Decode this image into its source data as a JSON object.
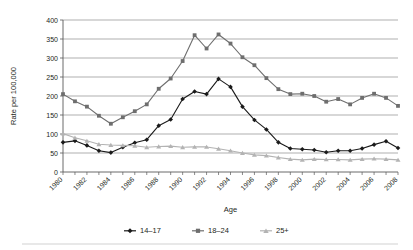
{
  "chart_data": {
    "type": "line",
    "title": "",
    "xlabel": "Age",
    "ylabel": "Rate per 100,000",
    "ylim": [
      0,
      400
    ],
    "ytick_step": 50,
    "yticks": [
      "0",
      "50",
      "100",
      "150",
      "200",
      "250",
      "300",
      "350",
      "400"
    ],
    "grid": true,
    "legend_position": "bottom",
    "x": [
      1980,
      1981,
      1982,
      1983,
      1984,
      1985,
      1986,
      1987,
      1988,
      1989,
      1990,
      1991,
      1992,
      1993,
      1994,
      1995,
      1996,
      1997,
      1998,
      1999,
      2000,
      2001,
      2002,
      2003,
      2004,
      2005,
      2006,
      2007,
      2008
    ],
    "xtick_labels": [
      "1980",
      "",
      "1982",
      "",
      "1984",
      "",
      "1986",
      "",
      "1988",
      "",
      "1990",
      "",
      "1992",
      "",
      "1994",
      "",
      "1996",
      "",
      "1998",
      "",
      "2000",
      "",
      "2002",
      "",
      "2004",
      "",
      "2006",
      "",
      "2008"
    ],
    "series": [
      {
        "name": "14–17",
        "color": "#1a1a1a",
        "marker": "diamond",
        "values": [
          78,
          82,
          70,
          56,
          51,
          65,
          77,
          85,
          122,
          138,
          192,
          212,
          205,
          245,
          224,
          172,
          137,
          112,
          78,
          62,
          60,
          58,
          52,
          56,
          56,
          62,
          72,
          81,
          63
        ]
      },
      {
        "name": "18–24",
        "color": "#6e6e6e",
        "marker": "square",
        "values": [
          205,
          186,
          172,
          148,
          127,
          144,
          160,
          178,
          219,
          246,
          292,
          360,
          325,
          362,
          338,
          302,
          281,
          247,
          218,
          205,
          206,
          200,
          185,
          192,
          178,
          195,
          206,
          195,
          174
        ]
      },
      {
        "name": "25+",
        "color": "#b3b3b3",
        "marker": "triangle",
        "values": [
          101,
          90,
          82,
          73,
          71,
          70,
          69,
          65,
          67,
          68,
          65,
          66,
          66,
          61,
          56,
          50,
          45,
          43,
          38,
          34,
          32,
          34,
          33,
          33,
          32,
          34,
          35,
          34,
          32
        ]
      }
    ]
  },
  "legend": {
    "items": [
      {
        "label": "14–17"
      },
      {
        "label": "18–24"
      },
      {
        "label": "25+"
      }
    ]
  }
}
